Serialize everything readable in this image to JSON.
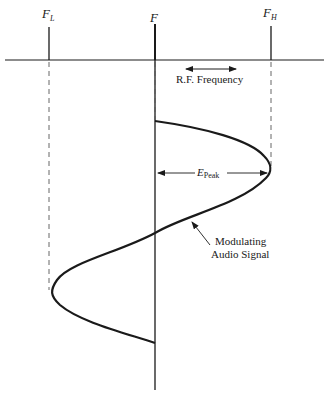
{
  "diagram": {
    "labels": {
      "f_low": {
        "main": "F",
        "sub": "L"
      },
      "f_center": {
        "main": "F",
        "sub": ""
      },
      "f_high": {
        "main": "F",
        "sub": "H"
      },
      "rf_frequency": "R.F. Frequency",
      "e_peak": {
        "main": "E",
        "sub": "Peak"
      },
      "modulating_line1": "Modulating",
      "modulating_line2": "Audio Signal"
    },
    "colors": {
      "ink": "#1a1a1a",
      "dash": "#555555",
      "background": "#ffffff"
    }
  }
}
